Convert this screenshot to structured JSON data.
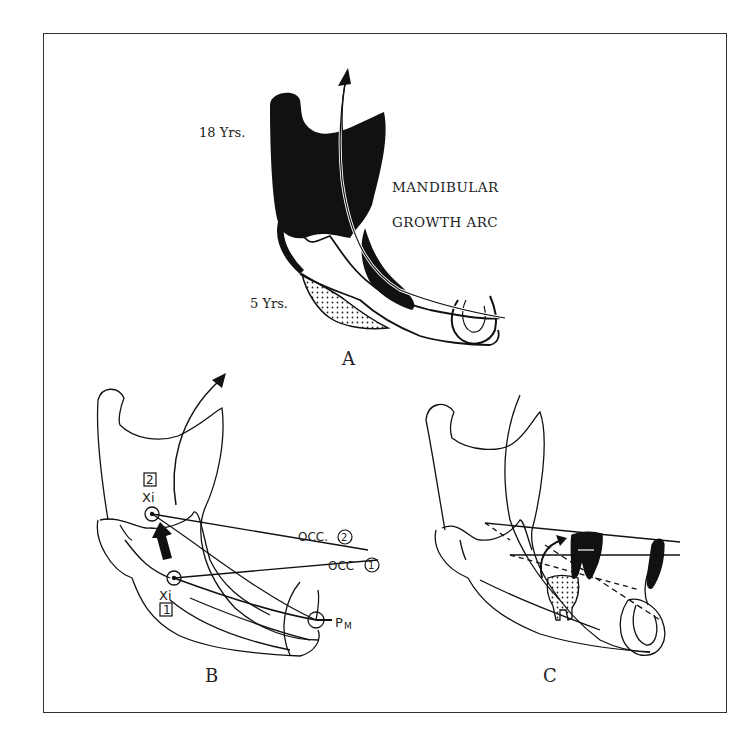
{
  "figure": {
    "panel_a": {
      "label": "A",
      "age_old": "18 Yrs.",
      "age_young": "5 Yrs.",
      "title_line1": "MANDIBULAR",
      "title_line2": "GROWTH ARC"
    },
    "panel_b": {
      "label": "B",
      "xi_top_number": "2",
      "xi_top_text": "Xi",
      "xi_bottom_text": "Xi",
      "xi_bottom_number": "1",
      "occ2_label": "OCC.",
      "occ2_number": "2",
      "occ1_label": "OCC",
      "occ1_number": "1",
      "pm_label": "P",
      "pm_sub": "M"
    },
    "panel_c": {
      "label": "C"
    },
    "colors": {
      "ink": "#111111",
      "frame": "#333333",
      "background": "#ffffff"
    }
  }
}
